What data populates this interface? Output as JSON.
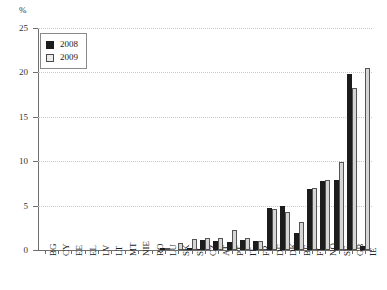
{
  "chart_data": {
    "type": "bar",
    "title": "",
    "subtitle": "",
    "xlabel": "",
    "ylabel": "%",
    "ylim": [
      0,
      25
    ],
    "yticks": [
      0,
      5,
      10,
      15,
      20,
      25
    ],
    "grid": true,
    "legend_position": "top-left",
    "categories": [
      "BG",
      "CY",
      "EE",
      "EL",
      "LV",
      "LT",
      "MT",
      "NIE",
      "RO",
      "LU",
      "SK",
      "SI",
      "CZ",
      "AT",
      "PT",
      "IT",
      "FR",
      "DE",
      "DK",
      "BE",
      "FI",
      "NO",
      "SE",
      "GB",
      "IE"
    ],
    "series": [
      {
        "name": "2008",
        "color": "#1c1c1c",
        "values": [
          0,
          0,
          0,
          0,
          0,
          0,
          0,
          0,
          0,
          0.15,
          0,
          0.25,
          1.1,
          1.0,
          0.9,
          1.1,
          1.0,
          4.7,
          5.0,
          1.9,
          6.9,
          7.8,
          7.9,
          19.8,
          0.4
        ]
      },
      {
        "name": "2009",
        "color": "#d6d6d6",
        "values": [
          0,
          0,
          0,
          0,
          0,
          0,
          0,
          0,
          0,
          0.05,
          0.75,
          1.2,
          1.3,
          1.4,
          2.2,
          1.4,
          1.0,
          4.6,
          4.3,
          3.1,
          7.0,
          7.9,
          9.9,
          18.3,
          20.5
        ]
      }
    ]
  },
  "legend": {
    "items": [
      {
        "label": "2008",
        "swatch": "filled-black-square"
      },
      {
        "label": "2009",
        "swatch": "open-light-square"
      }
    ]
  },
  "axes": {
    "y_unit_label": "%",
    "y_tick_labels": [
      "25",
      "20",
      "15",
      "10",
      "5",
      "0"
    ],
    "y_min": 0,
    "y_max": 25
  }
}
